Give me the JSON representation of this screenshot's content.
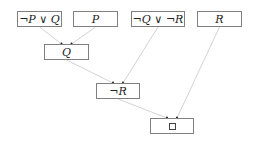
{
  "diagram": {
    "type": "resolution-proof-tree",
    "nodes": [
      {
        "id": "n1",
        "label": "¬P ∨ Q",
        "x": 17,
        "y": 11,
        "w": 45,
        "h": 16
      },
      {
        "id": "n2",
        "label": "P",
        "x": 73,
        "y": 11,
        "w": 45,
        "h": 16
      },
      {
        "id": "n3",
        "label": "¬Q ∨ ¬R",
        "x": 131,
        "y": 11,
        "w": 54,
        "h": 16
      },
      {
        "id": "n4",
        "label": "R",
        "x": 197,
        "y": 11,
        "w": 45,
        "h": 16
      },
      {
        "id": "n5",
        "label": "Q",
        "x": 44,
        "y": 44,
        "w": 45,
        "h": 16
      },
      {
        "id": "n6",
        "label": "¬R",
        "x": 96,
        "y": 83,
        "w": 44,
        "h": 16
      },
      {
        "id": "n7",
        "label": "□",
        "x": 150,
        "y": 118,
        "w": 44,
        "h": 16
      }
    ],
    "edges": [
      {
        "from": "n1",
        "to": "n5"
      },
      {
        "from": "n2",
        "to": "n5"
      },
      {
        "from": "n5",
        "to": "n6"
      },
      {
        "from": "n3",
        "to": "n6"
      },
      {
        "from": "n6",
        "to": "n7"
      },
      {
        "from": "n4",
        "to": "n7"
      }
    ],
    "colors": {
      "edge": "#c8c8c8",
      "border": "#808080",
      "arrowhead": "#222222"
    }
  }
}
